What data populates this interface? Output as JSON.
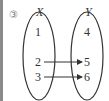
{
  "problem_label": "③",
  "set_x": {
    "name": "X",
    "elements": [
      "1",
      "2",
      "3"
    ]
  },
  "set_y": {
    "name": "Y",
    "elements": [
      "4",
      "5",
      "6"
    ]
  },
  "mappings": [
    {
      "from": "2",
      "to": "5"
    },
    {
      "from": "3",
      "to": "6"
    }
  ]
}
